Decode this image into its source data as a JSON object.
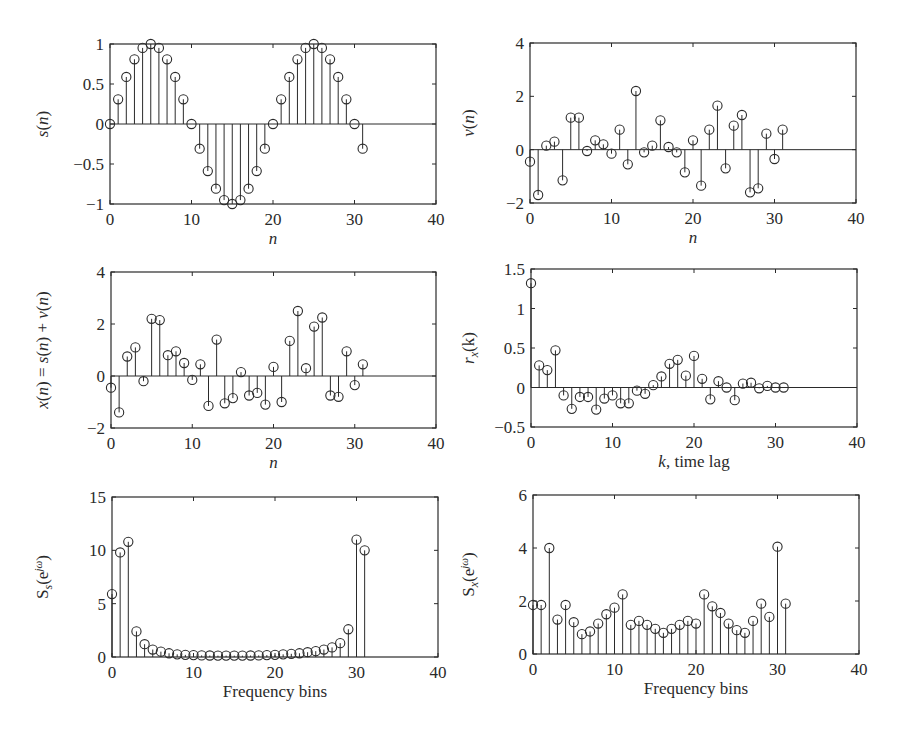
{
  "figure": {
    "ink_color": "#2a2a2a",
    "background": "#ffffff"
  },
  "chart_data": [
    {
      "id": "s_n",
      "type": "stem",
      "title": "",
      "xlabel": "n",
      "ylabel": "s(n)",
      "xlim": [
        0,
        40
      ],
      "ylim": [
        -1,
        1
      ],
      "xticks": [
        0,
        10,
        20,
        30,
        40
      ],
      "yticks": [
        -1,
        -0.5,
        0,
        0.5,
        1
      ],
      "ytick_labels": [
        "−1",
        "−0.5",
        "0",
        "0.5",
        "1"
      ],
      "grid": false,
      "x": [
        0,
        1,
        2,
        3,
        4,
        5,
        6,
        7,
        8,
        9,
        10,
        11,
        12,
        13,
        14,
        15,
        16,
        17,
        18,
        19,
        20,
        21,
        22,
        23,
        24,
        25,
        26,
        27,
        28,
        29,
        30,
        31
      ],
      "values": [
        0,
        0.309,
        0.588,
        0.809,
        0.951,
        1,
        0.951,
        0.809,
        0.588,
        0.309,
        0,
        -0.309,
        -0.588,
        -0.809,
        -0.951,
        -1,
        -0.951,
        -0.809,
        -0.588,
        -0.309,
        0,
        0.309,
        0.588,
        0.809,
        0.951,
        1,
        0.951,
        0.809,
        0.588,
        0.309,
        0,
        -0.309
      ],
      "frame": {
        "left": 110,
        "top": 44,
        "right": 436,
        "bottom": 204
      }
    },
    {
      "id": "v_n",
      "type": "stem",
      "title": "",
      "xlabel": "n",
      "ylabel": "v(n)",
      "xlim": [
        0,
        40
      ],
      "ylim": [
        -2,
        4
      ],
      "xticks": [
        0,
        10,
        20,
        30,
        40
      ],
      "yticks": [
        -2,
        0,
        2,
        4
      ],
      "ytick_labels": [
        "−2",
        "0",
        "2",
        "4"
      ],
      "grid": false,
      "x": [
        0,
        1,
        2,
        3,
        4,
        5,
        6,
        7,
        8,
        9,
        10,
        11,
        12,
        13,
        14,
        15,
        16,
        17,
        18,
        19,
        20,
        21,
        22,
        23,
        24,
        25,
        26,
        27,
        28,
        29,
        30,
        31
      ],
      "values": [
        -0.45,
        -1.7,
        0.15,
        0.3,
        -1.15,
        1.2,
        1.2,
        -0.05,
        0.35,
        0.2,
        -0.15,
        0.75,
        -0.55,
        2.2,
        -0.1,
        0.15,
        1.1,
        0.1,
        -0.1,
        -0.85,
        0.35,
        -1.35,
        0.75,
        1.65,
        -0.7,
        0.9,
        1.3,
        -1.6,
        -1.45,
        0.6,
        -0.35,
        0.75
      ],
      "frame": {
        "left": 530,
        "top": 43,
        "right": 856,
        "bottom": 203
      }
    },
    {
      "id": "x_n",
      "type": "stem",
      "title": "",
      "xlabel": "n",
      "ylabel": "x(n) = s(n) + v(n)",
      "xlim": [
        0,
        40
      ],
      "ylim": [
        -2,
        4
      ],
      "xticks": [
        0,
        10,
        20,
        30,
        40
      ],
      "yticks": [
        -2,
        0,
        2,
        4
      ],
      "ytick_labels": [
        "−2",
        "0",
        "2",
        "4"
      ],
      "grid": false,
      "x": [
        0,
        1,
        2,
        3,
        4,
        5,
        6,
        7,
        8,
        9,
        10,
        11,
        12,
        13,
        14,
        15,
        16,
        17,
        18,
        19,
        20,
        21,
        22,
        23,
        24,
        25,
        26,
        27,
        28,
        29,
        30,
        31
      ],
      "values": [
        -0.45,
        -1.4,
        0.75,
        1.1,
        -0.2,
        2.2,
        2.15,
        0.8,
        0.95,
        0.5,
        -0.15,
        0.45,
        -1.15,
        1.4,
        -1.05,
        -0.85,
        0.15,
        -0.75,
        -0.65,
        -1.1,
        0.35,
        -1.0,
        1.35,
        2.5,
        0.3,
        1.9,
        2.25,
        -0.75,
        -0.8,
        0.95,
        -0.35,
        0.45
      ],
      "frame": {
        "left": 111,
        "top": 272,
        "right": 436,
        "bottom": 428
      }
    },
    {
      "id": "r_x",
      "type": "stem",
      "title": "",
      "xlabel": "k, time lag",
      "ylabel": "r_x(k)",
      "xlim": [
        0,
        40
      ],
      "ylim": [
        -0.5,
        1.5
      ],
      "xticks": [
        0,
        10,
        20,
        30,
        40
      ],
      "yticks": [
        -0.5,
        0,
        0.5,
        1,
        1.5
      ],
      "ytick_labels": [
        "−0.5",
        "0",
        "0.5",
        "1",
        "1.5"
      ],
      "grid": false,
      "x": [
        0,
        1,
        2,
        3,
        4,
        5,
        6,
        7,
        8,
        9,
        10,
        11,
        12,
        13,
        14,
        15,
        16,
        17,
        18,
        19,
        20,
        21,
        22,
        23,
        24,
        25,
        26,
        27,
        28,
        29,
        30,
        31
      ],
      "values": [
        1.32,
        0.28,
        0.22,
        0.47,
        -0.1,
        -0.27,
        -0.12,
        -0.12,
        -0.28,
        -0.14,
        -0.1,
        -0.2,
        -0.2,
        -0.04,
        -0.08,
        0.03,
        0.14,
        0.3,
        0.35,
        0.15,
        0.4,
        0.11,
        -0.15,
        0.08,
        0.0,
        -0.16,
        0.05,
        0.06,
        -0.01,
        0.02,
        0.0,
        0.0
      ],
      "frame": {
        "left": 531,
        "top": 269,
        "right": 857,
        "bottom": 427
      }
    },
    {
      "id": "S_s",
      "type": "stem",
      "title": "",
      "xlabel": "Frequency bins",
      "ylabel": "S_s(e^{jω})",
      "xlim": [
        0,
        40
      ],
      "ylim": [
        0,
        15
      ],
      "xticks": [
        0,
        10,
        20,
        30,
        40
      ],
      "yticks": [
        0,
        5,
        10,
        15
      ],
      "ytick_labels": [
        "0",
        "5",
        "10",
        "15"
      ],
      "grid": false,
      "x": [
        0,
        1,
        2,
        3,
        4,
        5,
        6,
        7,
        8,
        9,
        10,
        11,
        12,
        13,
        14,
        15,
        16,
        17,
        18,
        19,
        20,
        21,
        22,
        23,
        24,
        25,
        26,
        27,
        28,
        29,
        30,
        31
      ],
      "values": [
        5.9,
        9.8,
        10.8,
        2.4,
        1.2,
        0.7,
        0.5,
        0.35,
        0.25,
        0.2,
        0.18,
        0.15,
        0.14,
        0.13,
        0.13,
        0.13,
        0.13,
        0.14,
        0.15,
        0.18,
        0.2,
        0.25,
        0.3,
        0.35,
        0.45,
        0.55,
        0.7,
        0.9,
        1.3,
        2.6,
        11.0,
        10.0
      ],
      "frame": {
        "left": 112,
        "top": 497,
        "right": 438,
        "bottom": 657
      }
    },
    {
      "id": "S_x",
      "type": "stem",
      "title": "",
      "xlabel": "Frequency bins",
      "ylabel": "S_x(e^{jω})",
      "xlim": [
        0,
        40
      ],
      "ylim": [
        0,
        6
      ],
      "xticks": [
        0,
        10,
        20,
        30,
        40
      ],
      "yticks": [
        0,
        2,
        4,
        6
      ],
      "ytick_labels": [
        "0",
        "2",
        "4",
        "6"
      ],
      "grid": false,
      "x": [
        0,
        1,
        2,
        3,
        4,
        5,
        6,
        7,
        8,
        9,
        10,
        11,
        12,
        13,
        14,
        15,
        16,
        17,
        18,
        19,
        20,
        21,
        22,
        23,
        24,
        25,
        26,
        27,
        28,
        29,
        30,
        31
      ],
      "values": [
        1.85,
        1.85,
        4.0,
        1.3,
        1.85,
        1.2,
        0.75,
        0.85,
        1.15,
        1.5,
        1.75,
        2.25,
        1.1,
        1.25,
        1.1,
        0.95,
        0.8,
        0.95,
        1.1,
        1.25,
        1.15,
        2.25,
        1.8,
        1.55,
        1.15,
        0.9,
        0.8,
        1.25,
        1.9,
        1.4,
        4.05,
        1.9
      ],
      "frame": {
        "left": 533,
        "top": 495,
        "right": 859,
        "bottom": 654
      }
    }
  ]
}
